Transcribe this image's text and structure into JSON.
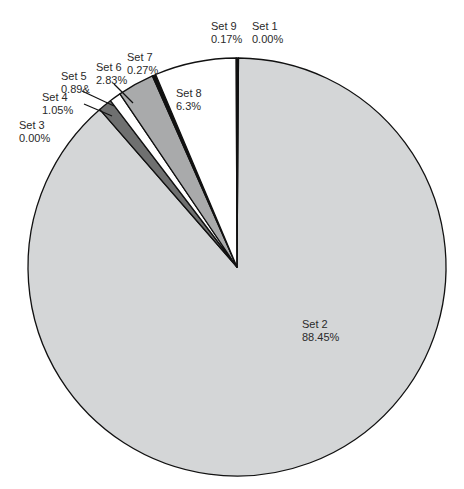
{
  "chart_data": {
    "type": "pie",
    "title": "",
    "start_angle_deg": 0,
    "direction": "clockwise",
    "slices": [
      {
        "name": "Set 1",
        "label": "0.00%",
        "value": 0.0,
        "color": "#d4d6d7"
      },
      {
        "name": "Set 2",
        "label": "88.45%",
        "value": 88.45,
        "color": "#d4d6d7"
      },
      {
        "name": "Set 3",
        "label": "0.00%",
        "value": 0.0,
        "color": "#d4d6d7"
      },
      {
        "name": "Set 4",
        "label": "1.05%",
        "value": 1.05,
        "color": "#6f7070"
      },
      {
        "name": "Set 5",
        "label": "0.89&",
        "value": 0.89,
        "color": "#ffffff"
      },
      {
        "name": "Set 6",
        "label": "2.83%",
        "value": 2.83,
        "color": "#a9aaab"
      },
      {
        "name": "Set 7",
        "label": "0.27%",
        "value": 0.27,
        "color": "#111111"
      },
      {
        "name": "Set 8",
        "label": "6.3%",
        "value": 6.3,
        "color": "#ffffff"
      },
      {
        "name": "Set 9",
        "label": "0.17%",
        "value": 0.17,
        "color": "#111111"
      }
    ],
    "legend": "none (direct labels)",
    "outline_color": "#111111"
  },
  "labels": {
    "set1": {
      "name": "Set 1",
      "pct": "0.00%"
    },
    "set2": {
      "name": "Set 2",
      "pct": "88.45%"
    },
    "set3": {
      "name": "Set 3",
      "pct": "0.00%"
    },
    "set4": {
      "name": "Set 4",
      "pct": "1.05%"
    },
    "set5": {
      "name": "Set 5",
      "pct": "0.89&"
    },
    "set6": {
      "name": "Set 6",
      "pct": "2.83%"
    },
    "set7": {
      "name": "Set 7",
      "pct": "0.27%"
    },
    "set8": {
      "name": "Set 8",
      "pct": "6.3%"
    },
    "set9": {
      "name": "Set 9",
      "pct": "0.17%"
    }
  }
}
